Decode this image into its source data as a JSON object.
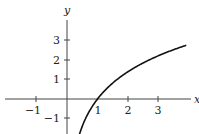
{
  "chart_data": {
    "type": "line",
    "title": "",
    "xlabel": "x",
    "ylabel": "y",
    "xlim": [
      -2.2,
      4.0
    ],
    "ylim": [
      -1.8,
      4.3
    ],
    "grid": false,
    "x_ticks": [
      -1,
      1,
      2,
      3
    ],
    "x_tick_labels": [
      "−1",
      "1",
      "2",
      "3"
    ],
    "y_ticks": [
      -1,
      1,
      2,
      3
    ],
    "y_tick_labels": [
      "−1",
      "1",
      "2",
      "3"
    ],
    "series": [
      {
        "name": "y = 2 ln x",
        "x": [
          0.4,
          0.5,
          0.75,
          1.0,
          1.5,
          2.0,
          2.5,
          3.0,
          3.5,
          3.9
        ],
        "y": [
          -1.83,
          -1.39,
          -0.58,
          0.0,
          0.81,
          1.39,
          1.83,
          2.2,
          2.51,
          2.72
        ],
        "color": "#111111"
      }
    ]
  },
  "labels": {
    "x_axis": "x",
    "y_axis": "y",
    "xt_m1": "−1",
    "xt_1": "1",
    "xt_2": "2",
    "xt_3": "3",
    "yt_m1": "−1",
    "yt_1": "1",
    "yt_2": "2",
    "yt_3": "3"
  }
}
